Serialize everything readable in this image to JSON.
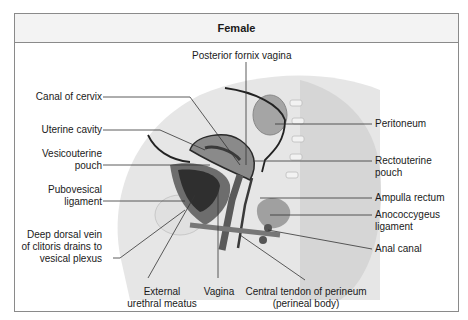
{
  "title": "Female",
  "labels": {
    "posterior_fornix": "Posterior fornix vagina",
    "canal_cervix": "Canal of cervix",
    "uterine_cavity": "Uterine cavity",
    "vesicouterine_1": "Vesicouterine",
    "vesicouterine_2": "pouch",
    "pubovesical_1": "Pubovesical",
    "pubovesical_2": "ligament",
    "deep_dorsal_1": "Deep dorsal vein",
    "deep_dorsal_2": "of clitoris drains to",
    "deep_dorsal_3": "vesical plexus",
    "external_meatus_1": "External",
    "external_meatus_2": "urethral meatus",
    "vagina": "Vagina",
    "central_tendon_1": "Central tendon of perineum",
    "central_tendon_2": "(perineal body)",
    "peritoneum": "Peritoneum",
    "rectouterine_1": "Rectouterine",
    "rectouterine_2": "pouch",
    "ampulla": "Ampulla rectum",
    "anococcygeus_1": "Anococcygeus",
    "anococcygeus_2": "ligament",
    "anal_canal": "Anal canal"
  },
  "colors": {
    "frame_border": "#8a8a8a",
    "header_bg": "#f3f3f3",
    "tissue_light": "#dcdcdc",
    "tissue_mid": "#9a9a9a",
    "tissue_dark": "#3a3a3a",
    "leader_line": "#333333"
  }
}
